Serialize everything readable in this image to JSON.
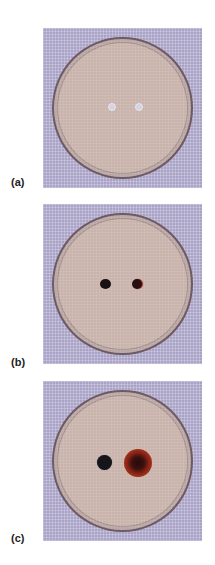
{
  "figure": {
    "panels": [
      {
        "label": "(a)",
        "description": "Petri dish with two clear wells before reaction",
        "wells": [
          {
            "type": "clear",
            "color": "#d8d3e4"
          },
          {
            "type": "clear",
            "color": "#d8d3e4"
          }
        ]
      },
      {
        "label": "(b)",
        "description": "Petri dish with two small dark spots",
        "wells": [
          {
            "type": "dark",
            "color": "#1a1212"
          },
          {
            "type": "dark-red-rim",
            "color": "#2a0f10",
            "rim_color": "#9a2a22"
          }
        ]
      },
      {
        "label": "(c)",
        "description": "Petri dish with dark spot and larger reddish-brown halo",
        "wells": [
          {
            "type": "dark",
            "color": "#15151a"
          },
          {
            "type": "halo",
            "color": "#3a1010",
            "halo_color": "#a8321c"
          }
        ]
      }
    ],
    "colors": {
      "background_grid": "#aaa3c8",
      "dish_agar": "#c9b4ac",
      "dish_rim": "#6e5a64"
    }
  }
}
